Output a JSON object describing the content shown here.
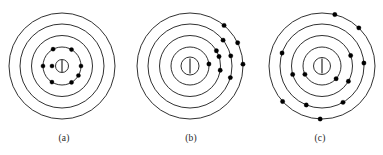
{
  "figure": {
    "background_color": "#ffffff",
    "stroke_color": "#1a1a1a",
    "electron_color": "#000000",
    "nucleus_fill": "#ffffff",
    "nucleus_bar_color": "#555555"
  },
  "panels": [
    {
      "id": "a",
      "label": "(a)",
      "center": {
        "x": 62,
        "y": 66
      },
      "nucleus": {
        "radius": 6.5,
        "bar_half_height": 6.0
      },
      "shells": [
        {
          "index": 1,
          "radius": 19
        },
        {
          "index": 2,
          "radius": 30.5
        },
        {
          "index": 3,
          "radius": 42
        },
        {
          "index": 4,
          "radius": 53
        }
      ],
      "electron_radius": 2.1,
      "electron_count": 8,
      "electrons": [
        {
          "shell": 1,
          "angle_deg": 60,
          "radius": 19
        },
        {
          "shell": 1,
          "angle_deg": 118,
          "radius": 19
        },
        {
          "shell": 1,
          "angle_deg": 180,
          "radius": 19
        },
        {
          "shell": 1,
          "angle_deg": 238,
          "radius": 19
        },
        {
          "shell": 1,
          "angle_deg": 300,
          "radius": 19
        },
        {
          "shell": 1,
          "angle_deg": 0,
          "radius": 19
        },
        {
          "shell": 1,
          "angle_deg": 330,
          "radius": 19
        },
        {
          "shell": 1,
          "angle_deg": 180,
          "radius": 10
        }
      ]
    },
    {
      "id": "b",
      "label": "(b)",
      "center": {
        "x": 63,
        "y": 66
      },
      "nucleus": {
        "radius": 9.0,
        "bar_half_height": 7.5
      },
      "shells": [
        {
          "index": 1,
          "radius": 19
        },
        {
          "index": 2,
          "radius": 30.5
        },
        {
          "index": 3,
          "radius": 42
        },
        {
          "index": 4,
          "radius": 53
        }
      ],
      "electron_radius": 2.2,
      "electron_count": 10,
      "electrons": [
        {
          "shell": 1,
          "angle_deg": 6,
          "radius": 19
        },
        {
          "shell": 2,
          "angle_deg": 30,
          "radius": 30.5
        },
        {
          "shell": 2,
          "angle_deg": 18,
          "radius": 30.5
        },
        {
          "shell": 2,
          "angle_deg": 352,
          "radius": 30.5
        },
        {
          "shell": 3,
          "angle_deg": 14,
          "radius": 42
        },
        {
          "shell": 3,
          "angle_deg": 344,
          "radius": 42
        },
        {
          "shell": 3,
          "angle_deg": 38,
          "radius": 42
        },
        {
          "shell": 4,
          "angle_deg": 50,
          "radius": 53
        },
        {
          "shell": 4,
          "angle_deg": 26,
          "radius": 53
        },
        {
          "shell": 4,
          "angle_deg": 2,
          "radius": 53
        }
      ]
    },
    {
      "id": "c",
      "label": "(c)",
      "center": {
        "x": 66,
        "y": 66
      },
      "nucleus": {
        "radius": 8.5,
        "bar_half_height": 7.5
      },
      "shells": [
        {
          "index": 1,
          "radius": 19
        },
        {
          "index": 2,
          "radius": 30.5
        },
        {
          "index": 3,
          "radius": 42
        },
        {
          "index": 4,
          "radius": 53
        }
      ],
      "electron_radius": 2.2,
      "electron_count": 13,
      "electrons": [
        {
          "shell": 1,
          "angle_deg": 206,
          "radius": 19
        },
        {
          "shell": 1,
          "angle_deg": 318,
          "radius": 19
        },
        {
          "shell": 2,
          "angle_deg": 20,
          "radius": 30.5
        },
        {
          "shell": 2,
          "angle_deg": 330,
          "radius": 30.5
        },
        {
          "shell": 2,
          "angle_deg": 196,
          "radius": 30.5
        },
        {
          "shell": 3,
          "angle_deg": 4,
          "radius": 42
        },
        {
          "shell": 3,
          "angle_deg": 162,
          "radius": 42
        },
        {
          "shell": 3,
          "angle_deg": 300,
          "radius": 42
        },
        {
          "shell": 3,
          "angle_deg": 248,
          "radius": 42
        },
        {
          "shell": 4,
          "angle_deg": 76,
          "radius": 53
        },
        {
          "shell": 4,
          "angle_deg": 46,
          "radius": 53
        },
        {
          "shell": 4,
          "angle_deg": 222,
          "radius": 53
        },
        {
          "shell": 4,
          "angle_deg": 268,
          "radius": 53
        }
      ]
    }
  ]
}
